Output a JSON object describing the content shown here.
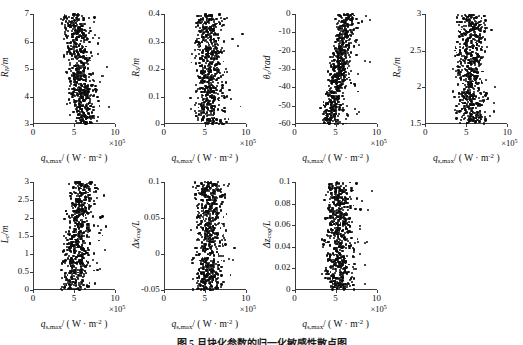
{
  "figure": {
    "caption": "图 5  月块化参数的归一化敏感性散点图",
    "x_axis_label": "q_s,max/ ( W · m-2 )",
    "x_exponent": "×10⁵",
    "x_ticks": [
      "0",
      "5",
      "10"
    ],
    "x_range": [
      0,
      10
    ],
    "marker_color": "#0d0d0d",
    "axis_color": "#3a3a3a"
  },
  "chart_data": {
    "type": "scatter",
    "title": "图 5  月块化参数的归一化敏感性散点图",
    "xlabel": "q_s,max/ ( W · m-2 )",
    "xlim": [
      0,
      10
    ],
    "x_scale_note": "×10^5",
    "grid": false,
    "legend": "none",
    "n_points_per_panel": 620,
    "panels": [
      {
        "id": "panel-rn",
        "ylabel": "R_N/m",
        "ylabel_html": "<i>R</i><span class='sub'>N</span>/m",
        "ylim": [
          3,
          7
        ],
        "yticks": [
          "3",
          "4",
          "5",
          "6",
          "7"
        ],
        "ytick_values": [
          3,
          4,
          5,
          6,
          7
        ],
        "trend": "negative",
        "x_center_at_ymin": 6.2,
        "x_center_at_ymax": 4.9,
        "x_spread": 1.25,
        "seed": 11
      },
      {
        "id": "panel-rs",
        "ylabel": "R_S/m",
        "ylabel_html": "<i>R</i><span class='sub'>S</span>/m",
        "ylim": [
          0,
          0.4
        ],
        "yticks": [
          "0",
          "0.1",
          "0.2",
          "0.3",
          "0.4"
        ],
        "ytick_values": [
          0,
          0.1,
          0.2,
          0.3,
          0.4
        ],
        "trend": "neutral",
        "x_center_at_ymin": 5.3,
        "x_center_at_ymax": 5.3,
        "x_spread": 1.35,
        "seed": 23
      },
      {
        "id": "panel-theta",
        "ylabel": "θ_c/rad",
        "ylabel_html": "<i>θ</i><span class='sub'>c</span>/rad",
        "ylim": [
          -60,
          0
        ],
        "yticks": [
          "0",
          "-10",
          "-20",
          "-30",
          "-40",
          "-50",
          "-60"
        ],
        "ytick_values": [
          0,
          -10,
          -20,
          -30,
          -40,
          -50,
          -60
        ],
        "trend": "positive",
        "x_center_at_ymin": 4.3,
        "x_center_at_ymax": 6.3,
        "x_spread": 1.0,
        "seed": 37
      },
      {
        "id": "panel-rm",
        "ylabel": "R_m/m",
        "ylabel_html": "<i>R</i><span class='sub'>m</span>/m",
        "ylim": [
          1.5,
          3
        ],
        "yticks": [
          "1.5",
          "2",
          "2.5",
          "3"
        ],
        "ytick_values": [
          1.5,
          2,
          2.5,
          3
        ],
        "trend": "neutral",
        "x_center_at_ymin": 5.4,
        "x_center_at_ymax": 5.4,
        "x_spread": 1.45,
        "seed": 41
      },
      {
        "id": "panel-lc",
        "ylabel": "L_c/m",
        "ylabel_html": "<i>L</i><span class='sub'>c</span>/m",
        "ylim": [
          0,
          3
        ],
        "yticks": [
          "0",
          "0.5",
          "1",
          "1.5",
          "2",
          "2.5",
          "3"
        ],
        "ytick_values": [
          0,
          0.5,
          1,
          1.5,
          2,
          2.5,
          3
        ],
        "trend": "positive-weak",
        "x_center_at_ymin": 4.8,
        "x_center_at_ymax": 5.9,
        "x_spread": 1.2,
        "seed": 53
      },
      {
        "id": "panel-dxcog",
        "ylabel": "Δx_cog/L",
        "ylabel_html": "Δ<i>x</i><span class='sub'>cog</span>/<i>L</i>",
        "ylim": [
          -0.05,
          0.1
        ],
        "yticks": [
          "-0.05",
          "0",
          "0.05",
          "0.1"
        ],
        "ytick_values": [
          -0.05,
          0,
          0.05,
          0.1
        ],
        "trend": "neutral",
        "x_center_at_ymin": 5.3,
        "x_center_at_ymax": 5.3,
        "x_spread": 1.35,
        "seed": 67
      },
      {
        "id": "panel-dzcog",
        "ylabel": "Δz_cog/L",
        "ylabel_html": "Δ<i>z</i><span class='sub'>cog</span>/<i>L</i>",
        "ylim": [
          0,
          0.1
        ],
        "yticks": [
          "0",
          "0.02",
          "0.04",
          "0.06",
          "0.08",
          "0.1"
        ],
        "ytick_values": [
          0,
          0.02,
          0.04,
          0.06,
          0.08,
          0.1
        ],
        "trend": "neutral",
        "x_center_at_ymin": 5.2,
        "x_center_at_ymax": 5.2,
        "x_spread": 1.25,
        "seed": 79
      }
    ]
  }
}
